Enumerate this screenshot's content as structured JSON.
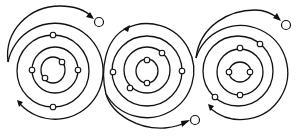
{
  "diagram": {
    "type": "atomic-orbit-ionization",
    "colors": {
      "stroke": "#111111",
      "background": "#ffffff",
      "electron_fill": "#ffffff"
    },
    "atoms": [
      {
        "name": "atom-left",
        "center": [
          53,
          70
        ],
        "nucleus_ellipse": {
          "rx": 12,
          "ry": 13
        },
        "orbit_radii": [
          25,
          37,
          48
        ],
        "electrons": [
          [
            62,
            62
          ],
          [
            45,
            78
          ],
          [
            32,
            70
          ],
          [
            78,
            70
          ],
          [
            53,
            35
          ],
          [
            53,
            107
          ]
        ],
        "free_electron": [
          99,
          22
        ],
        "escape_direction": "clockwise-top"
      },
      {
        "name": "atom-middle",
        "center": [
          147,
          71
        ],
        "nucleus_ellipse": {
          "rx": 11,
          "ry": 13
        },
        "orbit_radii": [
          23,
          35,
          47
        ],
        "electrons": [
          [
            147,
            60
          ],
          [
            147,
            83
          ],
          [
            162,
            53
          ],
          [
            130,
            88
          ],
          [
            113,
            72
          ],
          [
            182,
            71
          ]
        ],
        "free_electron": [
          195,
          120
        ],
        "escape_direction": "counterclockwise-bottom"
      },
      {
        "name": "atom-right",
        "center": [
          240,
          71
        ],
        "nucleus_ellipse": {
          "rx": 11,
          "ry": 10
        },
        "orbit_radii": [
          23,
          35,
          47
        ],
        "electrons": [
          [
            229,
            72
          ],
          [
            250,
            72
          ],
          [
            240,
            48
          ],
          [
            240,
            95
          ],
          [
            260,
            44
          ],
          [
            215,
            97
          ]
        ],
        "free_electron": [
          286,
          25
        ],
        "escape_direction": "clockwise-top"
      }
    ]
  }
}
